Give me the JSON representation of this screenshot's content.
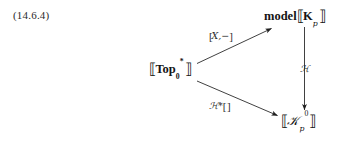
{
  "equation": {
    "number": "(14.6.4)"
  },
  "diagram": {
    "type": "commutative-diagram",
    "ink_color": "#141414",
    "background_color": "#ffffff",
    "nodes": [
      {
        "id": "top-right",
        "name": "model-Kp",
        "prefix": "model",
        "open_bracket": "⟦",
        "symbol": "K",
        "subscript": "p",
        "superscript": "",
        "close_bracket": "⟧",
        "plain": "model⟦Kₚ⟧"
      },
      {
        "id": "left",
        "name": "Top0-star",
        "prefix": "",
        "open_bracket": "⟦",
        "symbol": "Top",
        "subscript": "0",
        "superscript": "*",
        "close_bracket": "⟧",
        "plain": "⟦Top₀*⟧"
      },
      {
        "id": "bottom-right",
        "name": "Kp-zero",
        "prefix": "",
        "open_bracket": "⟦",
        "symbol": "𝒦",
        "subscript": "p",
        "superscript": "0",
        "close_bracket": "⟧",
        "plain": "⟦𝒦ₚ⁰⟧"
      }
    ],
    "arrows": [
      {
        "id": "upper-diagonal",
        "from": "left",
        "to": "top-right",
        "direction": "up-right",
        "label_open": "[",
        "label_body": "X,−",
        "label_close": "]",
        "label_plain": "[X,−]"
      },
      {
        "id": "right-vertical",
        "from": "top-right",
        "to": "bottom-right",
        "direction": "down",
        "label_open": "",
        "label_body": "ℋ",
        "label_close": "",
        "label_plain": "ℋ"
      },
      {
        "id": "lower-diagonal",
        "from": "left",
        "to": "bottom-right",
        "direction": "down-right",
        "label_open": "",
        "label_body": "ℋ*",
        "label_close": "[ ]",
        "label_plain": "ℋ*[ ]"
      }
    ]
  }
}
